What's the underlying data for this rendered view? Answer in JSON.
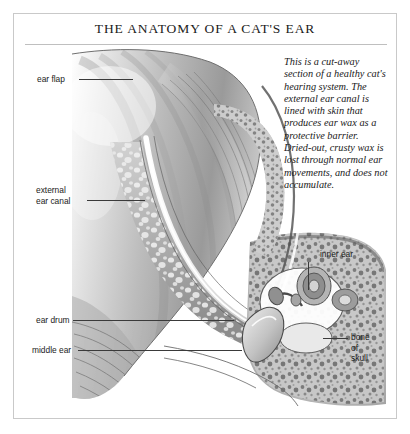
{
  "plate": {
    "title": "THE ANATOMY OF A CAT'S EAR",
    "caption": "This is a cut-away section of a healthy cat's hearing system. The external ear canal is lined with skin that produces ear wax as a protective barrier. Dried-out, crusty wax is lost through normal ear movements, and does not accumulate."
  },
  "labels": {
    "ear_flap": "ear flap",
    "external_ear_canal_line1": "external",
    "external_ear_canal_line2": "ear canal",
    "ear_drum": "ear drum",
    "middle_ear": "middle ear",
    "inner_ear": "inner ear",
    "bone_of_skull_line1": "bone",
    "bone_of_skull_line2": "of",
    "bone_of_skull_line3": "skull"
  },
  "colors": {
    "frame": "#c9c9c9",
    "rule": "#bfbfbf",
    "ink": "#1a1a1a",
    "leader": "#3a3a3a",
    "paper": "#ffffff",
    "tissue_light": "#d8d8d8",
    "tissue_mid": "#a9a9a9",
    "tissue_dark": "#6d6d6d",
    "bone": "#bdbdbd"
  },
  "figure": {
    "type": "anatomical-cutaway-illustration",
    "style": "grayscale pencil / stipple rendering",
    "structures": [
      "ear flap (pinna)",
      "external ear canal",
      "ear drum (tympanic membrane)",
      "middle ear",
      "inner ear",
      "bone of skull"
    ]
  }
}
